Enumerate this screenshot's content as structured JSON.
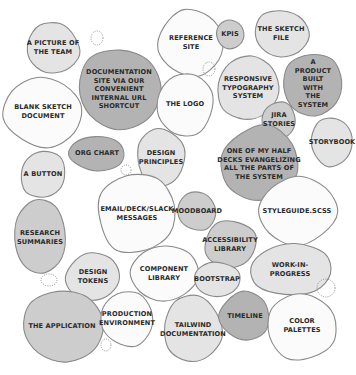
{
  "diagram": {
    "title": "",
    "colors": {
      "white": "#fbfbfb",
      "light": "#e4e4e4",
      "medium": "#cdcdcd",
      "dark": "#b3b3b3",
      "outline": "#8a8a8a",
      "text": "#2a2a2a",
      "placeholder_stroke": "#777777"
    },
    "bubbles": [
      {
        "id": "a-picture-of-the-team",
        "label": "A PICTURE OF\nTHE TEAM",
        "shade": "light"
      },
      {
        "id": "documentation-site",
        "label": "DOCUMENTATION\nSITE VIA OUR\nCONVENIENT\nINTERNAL URL\nSHORTCUT",
        "shade": "dark"
      },
      {
        "id": "reference-site",
        "label": "REFERENCE\nSITE",
        "shade": "white"
      },
      {
        "id": "kpis",
        "label": "KPIS",
        "shade": "medium"
      },
      {
        "id": "the-sketch-file",
        "label": "THE SKETCH\nFILE",
        "shade": "light"
      },
      {
        "id": "blank-sketch-document",
        "label": "BLANK SKETCH\nDOCUMENT",
        "shade": "white"
      },
      {
        "id": "the-logo",
        "label": "THE LOGO",
        "shade": "white"
      },
      {
        "id": "responsive-typography-system",
        "label": "RESPONSIVE\nTYPOGRAPHY\nSYSTEM",
        "shade": "light"
      },
      {
        "id": "a-product-built-with-the-system",
        "label": "A PRODUCT\nBUILT WITH\nTHE SYSTEM",
        "shade": "dark"
      },
      {
        "id": "jira-stories",
        "label": "JIRA\nSTORIES",
        "shade": "medium"
      },
      {
        "id": "storybook",
        "label": "STORYBOOK",
        "shade": "light"
      },
      {
        "id": "org-chart",
        "label": "ORG CHART",
        "shade": "dark"
      },
      {
        "id": "design-principles",
        "label": "DESIGN\nPRINCIPLES",
        "shade": "light"
      },
      {
        "id": "one-of-my-half-decks",
        "label": "ONE OF MY HALF\nDECKS EVANGELIZING\nALL THE PARTS OF\nTHE SYSTEM",
        "shade": "dark"
      },
      {
        "id": "a-button",
        "label": "A BUTTON",
        "shade": "light"
      },
      {
        "id": "email-deck-slack-messages",
        "label": "EMAIL/DECK/SLACK\nMESSAGES",
        "shade": "white"
      },
      {
        "id": "moodboard",
        "label": "MOODBOARD",
        "shade": "medium"
      },
      {
        "id": "styleguide-scss",
        "label": "STYLEGUIDE.SCSS",
        "shade": "white"
      },
      {
        "id": "research-summaries",
        "label": "RESEARCH\nSUMMARIES",
        "shade": "medium"
      },
      {
        "id": "accessibility-library",
        "label": "ACCESSIBILITY\nLIBRARY",
        "shade": "medium"
      },
      {
        "id": "component-library",
        "label": "COMPONENT\nLIBRARY",
        "shade": "white"
      },
      {
        "id": "design-tokens",
        "label": "DESIGN\nTOKENS",
        "shade": "light"
      },
      {
        "id": "bootstrap",
        "label": "BOOTSTRAP",
        "shade": "light"
      },
      {
        "id": "work-in-progress",
        "label": "WORK-IN-PROGRESS",
        "shade": "light"
      },
      {
        "id": "the-application",
        "label": "THE APPLICATION",
        "shade": "medium"
      },
      {
        "id": "production-environment",
        "label": "PRODUCTION\nENVIRONMENT",
        "shade": "white"
      },
      {
        "id": "tailwind-documentation",
        "label": "TAILWIND\nDOCUMENTATION",
        "shade": "light"
      },
      {
        "id": "timeline",
        "label": "TIMELINE",
        "shade": "dark"
      },
      {
        "id": "color-palettes",
        "label": "COLOR PALETTES",
        "shade": "white"
      }
    ],
    "placeholder_count": 7
  }
}
